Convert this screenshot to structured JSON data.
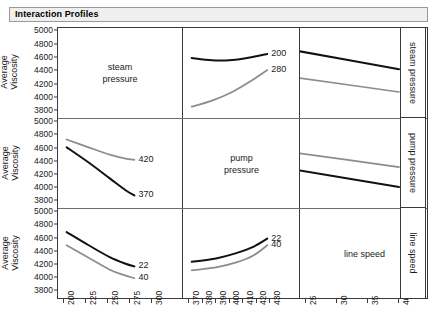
{
  "window": {
    "title": "Interaction Profiles"
  },
  "axes": {
    "y_label_line1": "Average",
    "y_label_line2": "Viscosity",
    "y_ticks": [
      "5000",
      "4800",
      "4600",
      "4400",
      "4200",
      "4000",
      "3800"
    ],
    "y_min": 3700,
    "y_max": 5050,
    "x_ticks_col1": [
      "200",
      "225",
      "250",
      "275",
      "300"
    ],
    "x_ticks_col2": [
      "370",
      "380",
      "390",
      "400",
      "410",
      "420",
      "430"
    ],
    "x_ticks_col3": [
      "25",
      "30",
      "35",
      "40"
    ]
  },
  "factors": {
    "row1": "steam pressure",
    "row2": "pump pressure",
    "row3": "line speed"
  },
  "diagonal_labels": {
    "c1": "steam\npressure",
    "c1_line1": "steam",
    "c1_line2": "pressure",
    "c2_line1": "pump",
    "c2_line2": "pressure",
    "c3_line1": "line speed"
  },
  "right_strips": [
    "steam pressure",
    "pump pressure",
    "line speed"
  ],
  "colors": {
    "series_dark": "#111111",
    "series_gray": "#8c8c8c",
    "frame": "#3a3a3a",
    "titlebar_bg": "#f0efef",
    "titlebar_border": "#9a9a9a"
  },
  "chart_data": {
    "type": "line",
    "title": "Interaction Profiles",
    "ylabel": "Average Viscosity",
    "ylim": [
      3700,
      5050
    ],
    "grid": false,
    "legend": "inline-end-labels",
    "layout": "3x3 interaction profile matrix",
    "row_factors": [
      "steam pressure",
      "pump pressure",
      "line speed"
    ],
    "col_factors": [
      "steam pressure",
      "pump pressure",
      "line speed"
    ],
    "col_x_ranges": [
      [
        200,
        300
      ],
      [
        370,
        430
      ],
      [
        25,
        40
      ]
    ],
    "panels": [
      {
        "row": 1,
        "col": 1,
        "kind": "label",
        "text": "steam pressure"
      },
      {
        "row": 1,
        "col": 2,
        "kind": "plot",
        "xlabel": "pump pressure",
        "xlim": [
          370,
          430
        ],
        "series": [
          {
            "name": "200",
            "color": "#111111",
            "x": [
              372,
              387,
              402,
              417,
              428
            ],
            "y": [
              4600,
              4565,
              4570,
              4615,
              4660
            ]
          },
          {
            "name": "280",
            "color": "#8c8c8c",
            "x": [
              372,
              387,
              402,
              417,
              428
            ],
            "y": [
              3870,
              3960,
              4090,
              4270,
              4420
            ]
          }
        ]
      },
      {
        "row": 1,
        "col": 3,
        "kind": "plot",
        "xlabel": "line speed",
        "xlim": [
          25,
          40
        ],
        "series": [
          {
            "name": "200",
            "color": "#111111",
            "x": [
              24,
              40
            ],
            "y": [
              4700,
              4430
            ]
          },
          {
            "name": "280",
            "color": "#8c8c8c",
            "x": [
              24,
              40
            ],
            "y": [
              4300,
              4090
            ]
          }
        ]
      },
      {
        "row": 2,
        "col": 1,
        "kind": "plot",
        "xlabel": "steam pressure",
        "xlim": [
          200,
          300
        ],
        "series": [
          {
            "name": "420",
            "color": "#8c8c8c",
            "x": [
              203,
              228,
              252,
              270,
              280
            ],
            "y": [
              4740,
              4620,
              4510,
              4450,
              4430
            ]
          },
          {
            "name": "370",
            "color": "#111111",
            "x": [
              203,
              228,
              252,
              270,
              280
            ],
            "y": [
              4620,
              4390,
              4150,
              3970,
              3890
            ]
          }
        ]
      },
      {
        "row": 2,
        "col": 2,
        "kind": "label",
        "text": "pump pressure"
      },
      {
        "row": 2,
        "col": 3,
        "kind": "plot",
        "xlabel": "line speed",
        "xlim": [
          25,
          40
        ],
        "series": [
          {
            "name": "420",
            "color": "#8c8c8c",
            "x": [
              24,
              40
            ],
            "y": [
              4530,
              4320
            ]
          },
          {
            "name": "370",
            "color": "#111111",
            "x": [
              24,
              40
            ],
            "y": [
              4270,
              4020
            ]
          }
        ]
      },
      {
        "row": 3,
        "col": 1,
        "kind": "plot",
        "xlabel": "steam pressure",
        "xlim": [
          200,
          300
        ],
        "series": [
          {
            "name": "22",
            "color": "#111111",
            "x": [
              203,
              228,
              252,
              270,
              280
            ],
            "y": [
              4700,
              4500,
              4320,
              4220,
              4180
            ]
          },
          {
            "name": "40",
            "color": "#8c8c8c",
            "x": [
              203,
              228,
              252,
              270,
              280
            ],
            "y": [
              4500,
              4310,
              4130,
              4040,
              4000
            ]
          }
        ]
      },
      {
        "row": 3,
        "col": 2,
        "kind": "plot",
        "xlabel": "pump pressure",
        "xlim": [
          370,
          430
        ],
        "series": [
          {
            "name": "22",
            "color": "#111111",
            "x": [
              372,
              390,
              405,
              418,
              428
            ],
            "y": [
              4250,
              4300,
              4380,
              4480,
              4600
            ]
          },
          {
            "name": "40",
            "color": "#8c8c8c",
            "x": [
              372,
              390,
              405,
              418,
              428
            ],
            "y": [
              4120,
              4165,
              4240,
              4350,
              4500
            ]
          }
        ]
      },
      {
        "row": 3,
        "col": 3,
        "kind": "label",
        "text": "line speed"
      }
    ]
  }
}
